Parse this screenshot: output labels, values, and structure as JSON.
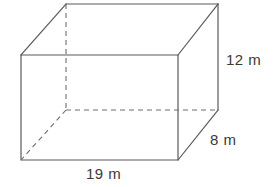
{
  "figure": {
    "name": "rectangular-prism",
    "stroke_color": "#5a5a5a",
    "hidden_stroke_color": "#6e6e6e",
    "background_color": "#ffffff",
    "text_color": "#3a3a3a"
  },
  "labels": {
    "height": "12 m",
    "depth": "8 m",
    "width": "19 m"
  },
  "dimensions": {
    "width_value": 19,
    "depth_value": 8,
    "height_value": 12,
    "unit": "m"
  },
  "geometry": {
    "front": {
      "top_left": [
        21,
        55
      ],
      "top_right": [
        178,
        55
      ],
      "bottom_right": [
        178,
        160
      ],
      "bottom_left": [
        21,
        160
      ]
    },
    "back": {
      "top_left": [
        66,
        4
      ],
      "top_right": [
        218,
        4
      ],
      "bottom_right": [
        218,
        110
      ],
      "bottom_left": [
        66,
        110
      ]
    },
    "hidden_vertex": [
      66,
      110
    ]
  }
}
